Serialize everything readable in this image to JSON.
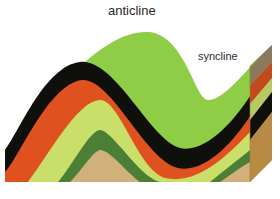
{
  "diagram": {
    "labels": {
      "anticline": "anticline",
      "syncline": "syncline"
    },
    "layers": [
      {
        "name": "top-surface",
        "color": "#8fcd46"
      },
      {
        "name": "black-layer",
        "color": "#0f0f0c"
      },
      {
        "name": "orange-layer",
        "color": "#df5220"
      },
      {
        "name": "yellow-green-layer",
        "color": "#c9df6a"
      },
      {
        "name": "dark-green-layer",
        "color": "#4b7f35"
      },
      {
        "name": "tan-layer",
        "color": "#d2b07b"
      }
    ],
    "side_face_shade": "#b58a45"
  }
}
